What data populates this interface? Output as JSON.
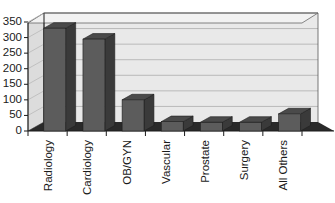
{
  "chart_data": {
    "type": "bar",
    "title": "",
    "subtitle": "",
    "xlabel": "",
    "ylabel": "",
    "categories": [
      "Radiology",
      "Cardiology",
      "OB/GYN",
      "Vascular",
      "Prostate",
      "Surgery",
      "All Others"
    ],
    "values": [
      330,
      295,
      100,
      30,
      28,
      28,
      55
    ],
    "series": [
      {
        "name": "Procedures",
        "values": [
          330,
          295,
          100,
          30,
          28,
          28,
          55
        ]
      }
    ],
    "ylim": [
      0,
      350
    ],
    "yticks": [
      0,
      50,
      100,
      150,
      200,
      250,
      300,
      350
    ],
    "ytick_labels": [
      "0",
      "50",
      "100",
      "150",
      "200",
      "250",
      "300",
      "350"
    ],
    "grid": true,
    "grid_axis": "y",
    "legend": false,
    "legend_position": "none",
    "three_d": true,
    "style": {
      "plot_background": "#e9e9e9",
      "gridline_color": "#b9b9b9",
      "wall_side_color": "#dcdcdc",
      "floor_color": "#2a2a2a",
      "bar_front_color": "#5c5c5c",
      "bar_side_color": "#3a3a3a",
      "bar_top_color": "#4a4a4a",
      "axis_color": "#1a1a1a",
      "text_color": "#1a1a1a"
    }
  }
}
